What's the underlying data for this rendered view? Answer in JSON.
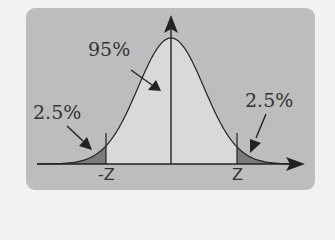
{
  "chart_data": {
    "type": "area",
    "title": "",
    "xlabel": "",
    "ylabel": "",
    "tick_labels": [
      "-z",
      "z"
    ],
    "annotations": [
      {
        "text": "95%",
        "region": "center",
        "value": 95
      },
      {
        "text": "2.5%",
        "region": "left-tail",
        "value": 2.5
      },
      {
        "text": "2.5%",
        "region": "right-tail",
        "value": 2.5
      }
    ],
    "regions": [
      {
        "name": "left-tail",
        "from": "-inf",
        "to": "-z",
        "percent": 2.5,
        "color": "#7a7a7a"
      },
      {
        "name": "center",
        "from": "-z",
        "to": "z",
        "percent": 95,
        "color": "#d9d9d9"
      },
      {
        "name": "right-tail",
        "from": "z",
        "to": "inf",
        "percent": 2.5,
        "color": "#7a7a7a"
      }
    ],
    "grid": false,
    "legend": null
  },
  "labels": {
    "center": "95%",
    "left_tail": "2.5%",
    "right_tail": "2.5%",
    "neg_z": "-Z",
    "pos_z": "Z"
  },
  "colors": {
    "panel": "#bdbdbd",
    "center_fill": "#d9d9d9",
    "tail_fill": "#7a7a7a",
    "stroke": "#222222"
  }
}
